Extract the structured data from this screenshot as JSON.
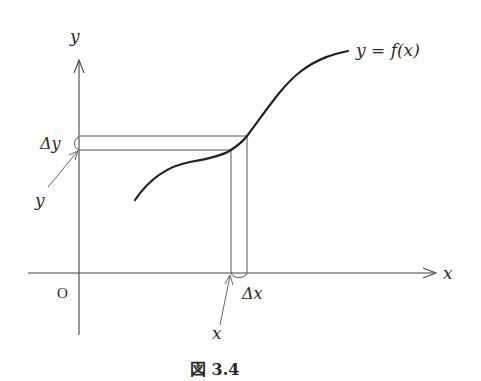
{
  "figure": {
    "caption": "図 3.4",
    "axes": {
      "x_label": "x",
      "y_label": "y",
      "origin_label": "O"
    },
    "curve_label": "y = f(x)",
    "annotations": {
      "delta_y": "Δy",
      "delta_x": "Δx",
      "point_y": "y",
      "point_x": "x"
    },
    "colors": {
      "line": "#555555",
      "curve": "#222222",
      "text": "#2a2a2a",
      "background": "#ffffff"
    }
  }
}
